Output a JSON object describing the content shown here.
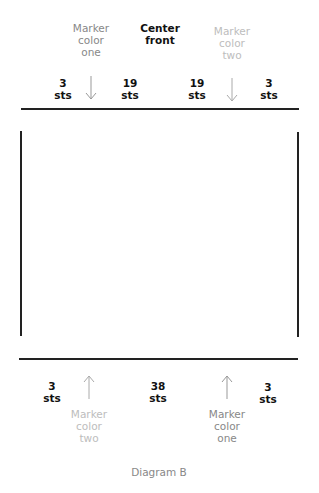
{
  "diagram": {
    "caption": "Diagram B",
    "top": {
      "markers": [
        {
          "id": "marker-one",
          "text": "Marker\ncolor\none",
          "x": 91,
          "color": "#888888",
          "arrow": "down"
        },
        {
          "id": "marker-two",
          "text": "Marker\ncolor\ntwo",
          "x": 232,
          "color": "#bdbdbd",
          "arrow": "down"
        }
      ],
      "center_label": "Center\nfront",
      "counts": [
        {
          "text": "3\nsts",
          "x": 63
        },
        {
          "text": "19\nsts",
          "x": 130
        },
        {
          "text": "19\nsts",
          "x": 197
        },
        {
          "text": "3\nsts",
          "x": 269
        }
      ]
    },
    "bottom": {
      "markers": [
        {
          "id": "marker-two",
          "text": "Marker\ncolor\ntwo",
          "x": 89,
          "color": "#bdbdbd",
          "arrow": "up"
        },
        {
          "id": "marker-one",
          "text": "Marker\ncolor\none",
          "x": 227,
          "color": "#888888",
          "arrow": "up"
        }
      ],
      "counts": [
        {
          "text": "3\nsts",
          "x": 52
        },
        {
          "text": "38\nsts",
          "x": 158
        },
        {
          "text": "3\nsts",
          "x": 268
        }
      ]
    }
  }
}
